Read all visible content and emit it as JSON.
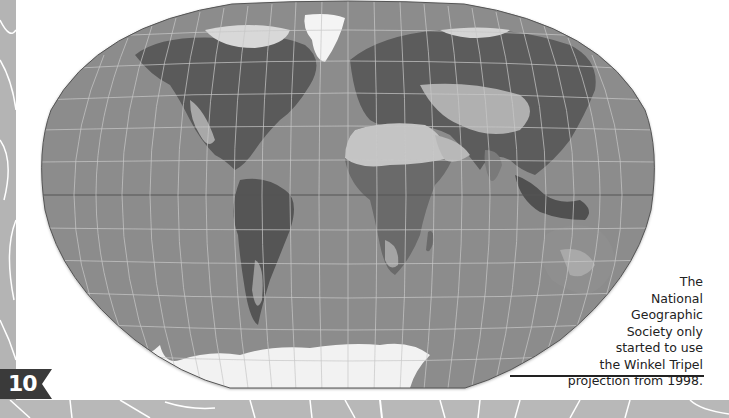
{
  "page": {
    "number": "10",
    "caption_lines": [
      "The",
      "National",
      "Geographic",
      "Society only",
      "started to use",
      "the Winkel Tripel",
      "projection from 1998."
    ]
  },
  "map": {
    "projection": "Winkel Tripel",
    "subject": "World map",
    "colors": {
      "ocean": "#8c8c8c",
      "graticule": "#c8c8c8",
      "ice": "#f4f4f4",
      "land_dark": "#505050",
      "land_mid": "#767676",
      "land_light": "#b8b8b8"
    }
  },
  "decor": {
    "strip_color": "#b4b4b4",
    "badge_color": "#3a3a3a"
  }
}
